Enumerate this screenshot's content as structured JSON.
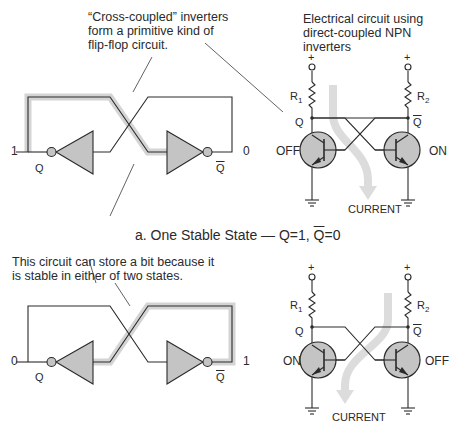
{
  "annotations": {
    "cross_coupled": [
      "“Cross-coupled” inverters",
      "form a primitive kind of",
      "flip-flop circuit."
    ],
    "electrical": [
      "Electrical circuit using",
      "direct-coupled NPN",
      "inverters"
    ],
    "store_bit": [
      "This circuit can store a bit because it",
      "is stable in either of two states."
    ]
  },
  "caption": {
    "prefix": "a. One Stable State — Q=1, ",
    "qbar": "Q",
    "suffix": "=0"
  },
  "top_logic": {
    "left_value": "1",
    "right_value": "0",
    "q_label": "Q",
    "qbar_label": "Q"
  },
  "bottom_logic": {
    "left_value": "0",
    "right_value": "1",
    "q_label": "Q",
    "qbar_label": "Q"
  },
  "top_circuit": {
    "plus_left": "+",
    "plus_right": "+",
    "r1": "R",
    "r1_sub": "1",
    "r2": "R",
    "r2_sub": "2",
    "q_label": "Q",
    "qbar_label": "Q",
    "left_state": "OFF",
    "right_state": "ON",
    "current_label": "CURRENT"
  },
  "bottom_circuit": {
    "plus_left": "+",
    "plus_right": "+",
    "r1": "R",
    "r1_sub": "1",
    "r2": "R",
    "r2_sub": "2",
    "q_label": "Q",
    "qbar_label": "Q",
    "left_state": "ON",
    "right_state": "OFF",
    "current_label": "CURRENT"
  },
  "colors": {
    "line": "#2a2a2a",
    "fill_gray": "#c4c4c4",
    "highlight": "#d4d4d4",
    "current_arrow": "#dcdcdc"
  }
}
